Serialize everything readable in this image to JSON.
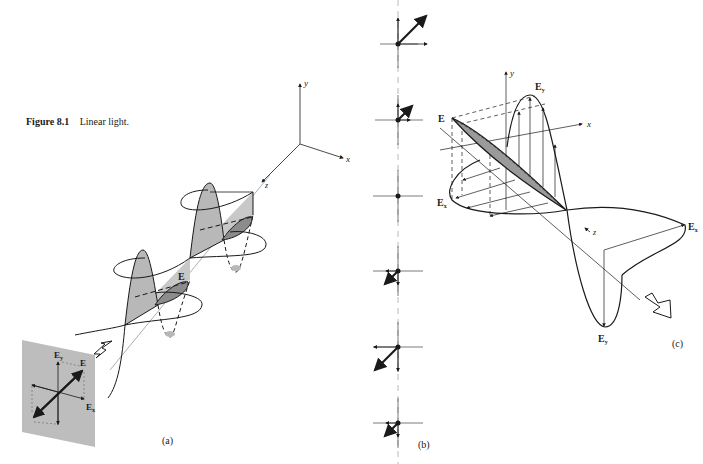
{
  "figure": {
    "number": "Figure 8.1",
    "title": "Linear light."
  },
  "panels": {
    "a": {
      "label": "(a)",
      "axes": {
        "x": "x",
        "y": "y",
        "z": "z"
      },
      "field_label": "E",
      "plane_labels": {
        "ey": "E",
        "ey_sub": "y",
        "e": "E",
        "ex": "E",
        "ex_sub": "x"
      }
    },
    "b": {
      "label": "(b)",
      "frame_count": 7,
      "description": "Sequence of field vector snapshots along propagation axis"
    },
    "c": {
      "label": "(c)",
      "axes": {
        "x": "x",
        "y": "y",
        "z": "z"
      },
      "labels": {
        "e": "E",
        "ey_top": "E",
        "ey_top_sub": "y",
        "ex_left": "E",
        "ex_left_sub": "x",
        "ex_right": "E",
        "ex_right_sub": "x",
        "ey_bottom": "E",
        "ey_bottom_sub": "y"
      }
    }
  },
  "colors": {
    "ink": "#1a1a1a",
    "shade": "#b8b8b8",
    "shade_dark": "#8c8c8c",
    "plane": "#bdbdbd"
  }
}
